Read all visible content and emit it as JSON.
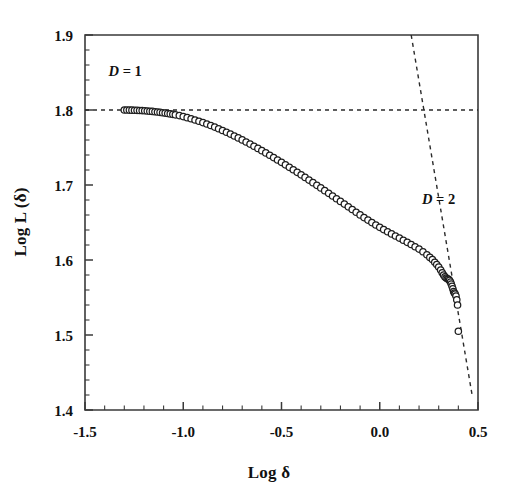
{
  "figure": {
    "background_color": "#ffffff",
    "marker_edge_color": "#1d1d1d",
    "marker_fill_color": "#ffffff",
    "axis_color": "#3a3a3a",
    "guide_color": "#2b2b2b"
  },
  "chart_data": {
    "type": "scatter",
    "title": "",
    "subtitle": "",
    "xlabel": "Log δ",
    "ylabel": "Log L (δ)",
    "xlim": [
      -1.5,
      0.5
    ],
    "ylim": [
      1.4,
      1.9
    ],
    "grid": false,
    "legend_position": "none",
    "x_ticks": [
      -1.5,
      -1.0,
      -0.5,
      0.0,
      0.5
    ],
    "x_tick_labels": [
      "-1.5",
      "-1.0",
      "-0.5",
      "0.0",
      "0.5"
    ],
    "x_minor_tick_step": 0.1,
    "y_ticks": [
      1.4,
      1.5,
      1.6,
      1.7,
      1.8,
      1.9
    ],
    "y_tick_labels": [
      "1.4",
      "1.5",
      "1.6",
      "1.7",
      "1.8",
      "1.9"
    ],
    "y_minor_tick_step": 0.02,
    "series": [
      {
        "name": "Richardson curve",
        "marker": "open-circle",
        "marker_size_px": 6.4,
        "x": [
          -1.3,
          -1.287,
          -1.274,
          -1.261,
          -1.248,
          -1.235,
          -1.222,
          -1.209,
          -1.196,
          -1.183,
          -1.17,
          -1.157,
          -1.144,
          -1.131,
          -1.118,
          -1.105,
          -1.092,
          -1.079,
          -1.066,
          -1.053,
          -1.04,
          -1.02,
          -1.0,
          -0.98,
          -0.96,
          -0.94,
          -0.92,
          -0.9,
          -0.88,
          -0.86,
          -0.84,
          -0.82,
          -0.8,
          -0.78,
          -0.76,
          -0.74,
          -0.72,
          -0.7,
          -0.68,
          -0.66,
          -0.64,
          -0.62,
          -0.6,
          -0.58,
          -0.56,
          -0.54,
          -0.52,
          -0.5,
          -0.48,
          -0.46,
          -0.44,
          -0.42,
          -0.4,
          -0.38,
          -0.36,
          -0.34,
          -0.32,
          -0.3,
          -0.28,
          -0.26,
          -0.24,
          -0.22,
          -0.2,
          -0.18,
          -0.16,
          -0.14,
          -0.12,
          -0.1,
          -0.08,
          -0.06,
          -0.04,
          -0.02,
          0.0,
          0.02,
          0.04,
          0.06,
          0.08,
          0.1,
          0.12,
          0.14,
          0.16,
          0.18,
          0.2,
          0.22,
          0.24,
          0.255,
          0.268,
          0.28,
          0.29,
          0.3,
          0.31,
          0.318,
          0.325,
          0.332,
          0.338,
          0.344,
          0.35,
          0.355,
          0.36,
          0.364,
          0.368,
          0.372,
          0.376,
          0.38,
          0.384,
          0.388,
          0.392,
          0.396,
          0.4
        ],
        "y": [
          1.8,
          1.8,
          1.7999,
          1.7998,
          1.7997,
          1.7996,
          1.7994,
          1.7992,
          1.799,
          1.7987,
          1.7984,
          1.7981,
          1.7977,
          1.7973,
          1.7969,
          1.7964,
          1.7959,
          1.7954,
          1.7948,
          1.7942,
          1.7936,
          1.7925,
          1.7912,
          1.7898,
          1.7883,
          1.7867,
          1.785,
          1.7832,
          1.7813,
          1.7793,
          1.7772,
          1.775,
          1.7727,
          1.7703,
          1.7679,
          1.7654,
          1.7628,
          1.7601,
          1.7574,
          1.7546,
          1.7517,
          1.7488,
          1.7458,
          1.7428,
          1.7397,
          1.7366,
          1.7334,
          1.7302,
          1.7269,
          1.7236,
          1.7203,
          1.7169,
          1.7135,
          1.7101,
          1.7066,
          1.7031,
          1.6996,
          1.6961,
          1.6925,
          1.6889,
          1.6853,
          1.6817,
          1.6781,
          1.6745,
          1.6709,
          1.6673,
          1.6637,
          1.6601,
          1.6566,
          1.6532,
          1.6499,
          1.6467,
          1.6436,
          1.6406,
          1.6377,
          1.6348,
          1.632,
          1.6292,
          1.6264,
          1.6236,
          1.6207,
          1.6177,
          1.6145,
          1.611,
          1.607,
          1.6035,
          1.6005,
          1.597,
          1.594,
          1.5905,
          1.5865,
          1.583,
          1.58,
          1.5775,
          1.576,
          1.575,
          1.5742,
          1.5728,
          1.5705,
          1.568,
          1.565,
          1.5615,
          1.558,
          1.556,
          1.5545,
          1.552,
          1.547,
          1.54,
          1.505
        ]
      }
    ],
    "reference_lines": [
      {
        "label": "D = 1",
        "label_italic_part": "D",
        "label_rest": " = 1",
        "style": "dashed",
        "slope": 0,
        "points": [
          [
            -1.5,
            1.8
          ],
          [
            0.5,
            1.8
          ]
        ],
        "description": "Horizontal dashed line at Log L = 1.80 representing topological dimension D = 1"
      },
      {
        "label": "D = 2",
        "label_italic_part": "D",
        "label_rest": " = 2",
        "style": "dashed",
        "slope": -1,
        "points": [
          [
            0.16,
            1.9
          ],
          [
            0.47,
            1.42
          ]
        ],
        "description": "Steep dashed line of slope -1 representing dimension D = 2"
      }
    ],
    "annotations": [
      {
        "text": "D = 1",
        "x": -1.38,
        "y": 1.845
      },
      {
        "text": "D = 2",
        "x": 0.215,
        "y": 1.675
      }
    ]
  }
}
